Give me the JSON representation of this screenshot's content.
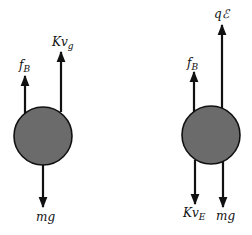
{
  "colors": {
    "ball_fill": "#6b6b6b",
    "stroke": "#111111",
    "background": "#ffffff"
  },
  "figures": [
    {
      "name": "left-free-body",
      "forces": [
        {
          "id": "buoyant",
          "label_main": "f",
          "label_sub": "B",
          "direction": "up"
        },
        {
          "id": "drag",
          "label_main": "Kv",
          "label_sub": "g",
          "direction": "up"
        },
        {
          "id": "gravity",
          "label_main": "mg",
          "label_sub": "",
          "direction": "down"
        }
      ]
    },
    {
      "name": "right-free-body",
      "forces": [
        {
          "id": "electric",
          "label_main": "qℰ",
          "label_sub": "",
          "direction": "up"
        },
        {
          "id": "buoyant",
          "label_main": "f",
          "label_sub": "B",
          "direction": "up"
        },
        {
          "id": "drag",
          "label_main": "Kv",
          "label_sub": "E",
          "direction": "down"
        },
        {
          "id": "gravity",
          "label_main": "mg",
          "label_sub": "",
          "direction": "down"
        }
      ]
    }
  ]
}
